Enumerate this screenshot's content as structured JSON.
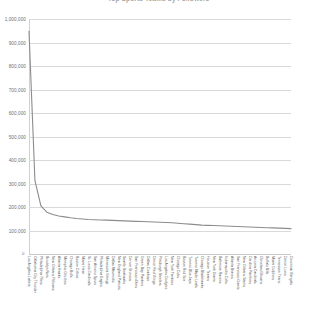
{
  "chart": {
    "title": "Top Sports Teams by Followers",
    "y_axis_label": "",
    "x_axis_label": "",
    "origin_label": "0"
  },
  "chart_data": {
    "type": "line",
    "title": "Top Sports Teams by Followers",
    "xlabel": "",
    "ylabel": "",
    "ylim": [
      0,
      1000000
    ],
    "grid": true,
    "legend": "none",
    "yticks": [
      0,
      100000,
      200000,
      300000,
      400000,
      500000,
      600000,
      700000,
      800000,
      900000,
      1000000
    ],
    "ytick_labels": [
      "0",
      "100,000",
      "200,000",
      "300,000",
      "400,000",
      "500,000",
      "600,000",
      "700,000",
      "800,000",
      "900,000",
      "1,000,000"
    ],
    "categories": [
      "Los Angeles Lakers",
      "Oklahoma City Thunder",
      "Philadelphia 76ers",
      "Brooklyn Nets",
      "New Orleans Pelicans",
      "Atlanta Hawks",
      "Memphis Grizzlies",
      "Chicago Bulls",
      "Boston Celtics",
      "Miami Heat",
      "St. Louis Cardinals",
      "San Antonio Spurs",
      "Philadelphia Eagles",
      "Minnesota Vikings",
      "Dallas Mavericks",
      "New England Patriots",
      "Seattle Seahawks",
      "Denver Broncos",
      "San Francisco 49ers",
      "Green Bay Packers",
      "Dallas Cowboys",
      "Detroit Red Wings",
      "Pittsburgh Steelers",
      "Los Angeles Dodgers",
      "New York Yankees",
      "Chicago Cubs",
      "Boston Red Sox",
      "Toronto Blue Jays",
      "Toronto Maple Leafs",
      "Chicago Blackhawks",
      "Houston Texans",
      "New York Giants",
      "Baltimore Ravens",
      "Indianapolis Colts",
      "Atlanta Braves",
      "San Francisco Giants",
      "New Orleans Saints",
      "Carolina Panthers",
      "Arizona Cardinals",
      "Cleveland Browns",
      "Buffalo Bills",
      "Miami Dolphins",
      "Tennessee Titans",
      "Detroit Lions",
      "Cincinnati Bengals"
    ],
    "values": [
      948000,
      312000,
      205000,
      178000,
      168000,
      162000,
      158000,
      154000,
      151000,
      149000,
      147000,
      146000,
      145000,
      144000,
      143000,
      142000,
      141000,
      140000,
      139000,
      138000,
      137000,
      136000,
      135000,
      134000,
      133000,
      131000,
      129000,
      127000,
      125000,
      123000,
      122000,
      121000,
      120000,
      119000,
      118000,
      117000,
      116000,
      115000,
      114000,
      113000,
      112000,
      111000,
      110000,
      109000,
      108000
    ],
    "series_color": "#8c8c8c"
  }
}
